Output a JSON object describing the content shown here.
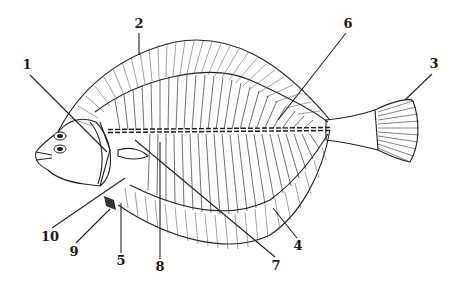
{
  "figure": {
    "colors": {
      "ink": "#222222",
      "background": "#ffffff"
    }
  },
  "labels": [
    {
      "id": "1",
      "text": "1",
      "x": 27,
      "y": 69,
      "target": [
        107,
        152
      ]
    },
    {
      "id": "2",
      "text": "2",
      "x": 139,
      "y": 28,
      "target": [
        139,
        55
      ]
    },
    {
      "id": "3",
      "text": "3",
      "x": 434,
      "y": 68,
      "target": [
        405,
        100
      ]
    },
    {
      "id": "4",
      "text": "4",
      "x": 298,
      "y": 250,
      "target": [
        273,
        208
      ]
    },
    {
      "id": "5",
      "text": "5",
      "x": 121,
      "y": 265,
      "target": [
        121,
        203
      ]
    },
    {
      "id": "6",
      "text": "6",
      "x": 348,
      "y": 28,
      "target": [
        278,
        120
      ]
    },
    {
      "id": "7",
      "text": "7",
      "x": 276,
      "y": 270,
      "target": [
        135,
        140
      ]
    },
    {
      "id": "8",
      "text": "8",
      "x": 160,
      "y": 271,
      "target": [
        160,
        142
      ]
    },
    {
      "id": "9",
      "text": "9",
      "x": 74,
      "y": 256,
      "target": [
        110,
        209
      ]
    },
    {
      "id": "10",
      "text": "10",
      "x": 50,
      "y": 241,
      "target": [
        125,
        178
      ]
    }
  ]
}
